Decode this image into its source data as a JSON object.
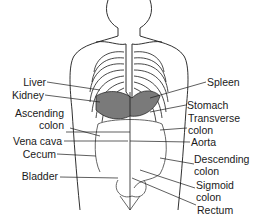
{
  "diagram": {
    "title": "",
    "colors": {
      "line": "#1a1a1a",
      "organ_shade": "#7a7a7a",
      "background": "#ffffff"
    },
    "labels_left": [
      {
        "id": "liver",
        "text": "Liver"
      },
      {
        "id": "kidney",
        "text": "Kidney"
      },
      {
        "id": "ascending-colon",
        "line1": "Ascending",
        "line2": "colon"
      },
      {
        "id": "vena-cava",
        "text": "Vena cava"
      },
      {
        "id": "cecum",
        "text": "Cecum"
      },
      {
        "id": "bladder",
        "text": "Bladder"
      }
    ],
    "labels_right": [
      {
        "id": "spleen",
        "text": "Spleen"
      },
      {
        "id": "stomach",
        "text": "Stomach"
      },
      {
        "id": "transverse-colon",
        "line1": "Transverse",
        "line2": "colon"
      },
      {
        "id": "aorta",
        "text": "Aorta"
      },
      {
        "id": "descending-colon",
        "line1": "Descending",
        "line2": "colon"
      },
      {
        "id": "sigmoid-colon",
        "line1": "Sigmoid",
        "line2": "colon"
      },
      {
        "id": "rectum",
        "text": "Rectum"
      }
    ]
  }
}
